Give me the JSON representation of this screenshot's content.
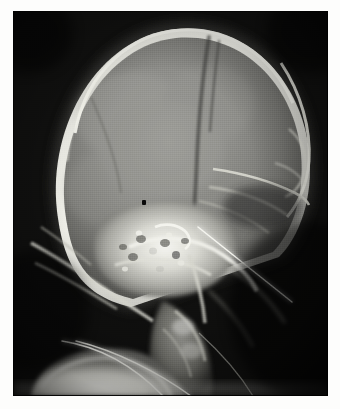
{
  "image": {
    "kind": "radiograph",
    "modality": "X-ray",
    "view": "lateral skull",
    "orientation": "face to the right",
    "alt_text": "Lateral skull radiograph showing the cranial vault, dense skull base, a thin radiopaque needle crossing the mid-face toward the lower right, two curved radiopaque tubes at the lower left, and a small opaque dot marker over the sella region.",
    "background_color": "#050505",
    "film_tone": "#8d8d8a",
    "border_color": "#fdfdfc",
    "plate": {
      "left": 13,
      "top": 11,
      "width": 315,
      "height": 385
    }
  },
  "markers": [
    {
      "name": "opaque-dot-marker",
      "label": "",
      "shape": "dot",
      "color": "#090909",
      "x": 142,
      "y": 200
    }
  ],
  "instruments": [
    {
      "name": "needle",
      "label": "",
      "color": "#f2f2ee",
      "x1": 198,
      "y1": 226,
      "x2": 292,
      "y2": 302
    },
    {
      "name": "tube-anterior",
      "label": "",
      "color": "#e8e8e2",
      "x1": 62,
      "y1": 341,
      "x2": 186,
      "y2": 398
    },
    {
      "name": "tube-posterior",
      "label": "",
      "color": "#e2e2dc",
      "x1": 76,
      "y1": 341,
      "x2": 212,
      "y2": 398
    }
  ],
  "anatomy": [
    {
      "name": "cranial-vault",
      "label": ""
    },
    {
      "name": "frontal-bone",
      "label": ""
    },
    {
      "name": "occipital-bone",
      "label": ""
    },
    {
      "name": "coronal-suture",
      "label": ""
    },
    {
      "name": "skull-base",
      "label": ""
    },
    {
      "name": "sella-turcica",
      "label": ""
    },
    {
      "name": "petrous-temporal-bone",
      "label": ""
    },
    {
      "name": "facial-bones",
      "label": ""
    },
    {
      "name": "mandible",
      "label": ""
    },
    {
      "name": "cervical-spine",
      "label": ""
    },
    {
      "name": "soft-tissue-shoulder",
      "label": ""
    }
  ],
  "annotations": [],
  "caption": ""
}
